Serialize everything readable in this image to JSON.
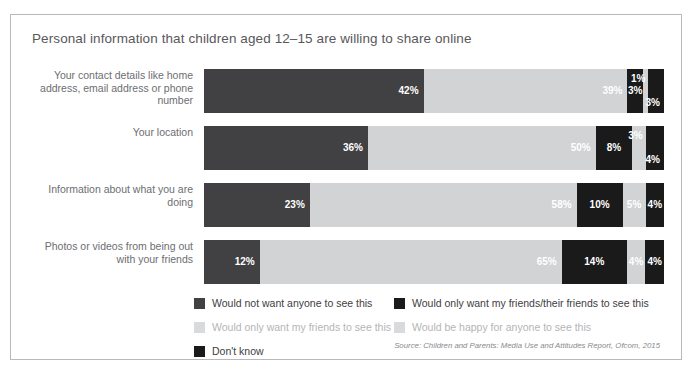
{
  "chart_data": {
    "type": "bar",
    "subtype": "stacked-horizontal-100",
    "title": "Personal information that children aged 12–15 are willing to share online",
    "xlabel": "",
    "ylabel": "",
    "xlim": [
      0,
      100
    ],
    "grid": false,
    "legend_position": "bottom",
    "categories": [
      "Your contact details like home address, email address or phone number",
      "Your location",
      "Information about what you are doing",
      "Photos or videos from being out with your friends"
    ],
    "series": [
      {
        "name": "Would not want anyone to see this",
        "color": "#414042",
        "values": [
          42,
          36,
          23,
          12
        ]
      },
      {
        "name": "Would only want my friends to see this",
        "color": "#d1d3d4",
        "values": [
          39,
          50,
          58,
          65
        ]
      },
      {
        "name": "Would only want my friends/their friends to see this",
        "color": "#1a1a1a",
        "values": [
          3,
          8,
          10,
          14
        ]
      },
      {
        "name": "Would be happy for anyone to see this",
        "color": "#d1d3d4",
        "values": [
          1,
          3,
          5,
          4
        ]
      },
      {
        "name": "Don't know",
        "color": "#1a1a1a",
        "values": [
          3,
          4,
          4,
          4
        ]
      }
    ],
    "value_labels": [
      [
        "42%",
        "39%",
        "3%",
        "1%",
        "3%"
      ],
      [
        "36%",
        "50%",
        "8%",
        "3%",
        "4%"
      ],
      [
        "23%",
        "58%",
        "10%",
        "5%",
        "4%"
      ],
      [
        "12%",
        "65%",
        "14%",
        "4%",
        "4%"
      ]
    ],
    "source": "Source: Children and Parents: Media Use and Attitudes Report, Ofcom, 2015"
  },
  "legend": {
    "left_column": [
      {
        "label": "Would not want anyone to see this",
        "color": "#414042",
        "muted": false
      },
      {
        "label": "Would only want my friends to see this",
        "color": "#d9dadb",
        "muted": true
      },
      {
        "label": "Don't know",
        "color": "#1a1a1a",
        "muted": false
      }
    ],
    "right_column": [
      {
        "label": "Would only want my friends/their friends to see this",
        "color": "#1a1a1a",
        "muted": false
      },
      {
        "label": "Would be happy for anyone to see this",
        "color": "#d9dadb",
        "muted": true
      }
    ]
  }
}
